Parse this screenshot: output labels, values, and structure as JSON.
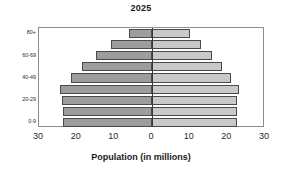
{
  "chart_data": {
    "type": "bar",
    "title": "2025",
    "xlabel": "Population (in millions)",
    "ylabel": "",
    "orientation": "horizontal",
    "layout": "population-pyramid",
    "grid": false,
    "legend": "none",
    "xlim": [
      -30,
      30
    ],
    "xticks": [
      30,
      20,
      10,
      0,
      10,
      20,
      30
    ],
    "xtick_labels": [
      "30",
      "20",
      "10",
      "0",
      "10",
      "20",
      "30"
    ],
    "categories": [
      "0-9",
      "10-19",
      "20-29",
      "30-39",
      "40-49",
      "50-59",
      "60-69",
      "70-79",
      "80+"
    ],
    "ytick_labels": [
      "0-9",
      "20-29",
      "40-49",
      "60-69",
      "80+"
    ],
    "series": [
      {
        "name": "left",
        "color": "#9d9d9d",
        "values": [
          23.5,
          23.5,
          24.0,
          24.5,
          21.5,
          18.5,
          15.0,
          11.0,
          6.0
        ]
      },
      {
        "name": "right",
        "color": "#c9c9c9",
        "values": [
          22.5,
          22.5,
          22.5,
          23.0,
          21.0,
          18.5,
          16.0,
          13.0,
          10.0
        ]
      }
    ]
  },
  "colors": {
    "bar_left": "#9d9d9d",
    "bar_right": "#c9c9c9",
    "bar_edge": "#4a4a4a",
    "frame": "#8d8d8d",
    "zero_line": "#3a3a3a",
    "text": "#1a1a1a",
    "background": "#ffffff"
  }
}
